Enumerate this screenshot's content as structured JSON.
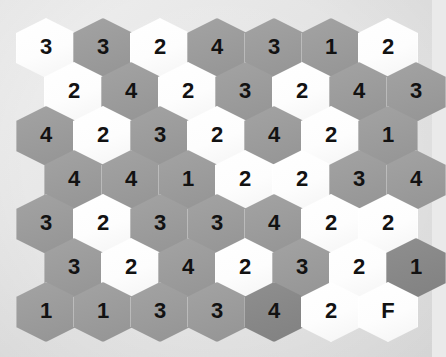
{
  "app": {
    "name": "hex-number-grid",
    "title": "Hexagonal Number Grid Puzzle"
  },
  "board": {
    "background_color": "#e4e4e4",
    "rows": 7,
    "columns": 7,
    "tile_colors": {
      "light": "#ffffff",
      "gray": "#9b9b9b",
      "dark": "#878787"
    },
    "text_color": "#121212"
  },
  "grid": {
    "rows": [
      {
        "index": 1,
        "offset": false,
        "cells": [
          {
            "value": "3",
            "shade": "light"
          },
          {
            "value": "3",
            "shade": "gray"
          },
          {
            "value": "2",
            "shade": "light"
          },
          {
            "value": "4",
            "shade": "gray"
          },
          {
            "value": "3",
            "shade": "gray"
          },
          {
            "value": "1",
            "shade": "gray"
          },
          {
            "value": "2",
            "shade": "light"
          }
        ]
      },
      {
        "index": 2,
        "offset": true,
        "cells": [
          {
            "value": "2",
            "shade": "light"
          },
          {
            "value": "4",
            "shade": "gray"
          },
          {
            "value": "2",
            "shade": "light"
          },
          {
            "value": "3",
            "shade": "gray"
          },
          {
            "value": "2",
            "shade": "light"
          },
          {
            "value": "4",
            "shade": "gray"
          },
          {
            "value": "3",
            "shade": "gray"
          }
        ]
      },
      {
        "index": 3,
        "offset": false,
        "cells": [
          {
            "value": "4",
            "shade": "gray"
          },
          {
            "value": "2",
            "shade": "light"
          },
          {
            "value": "3",
            "shade": "gray"
          },
          {
            "value": "2",
            "shade": "light"
          },
          {
            "value": "4",
            "shade": "gray"
          },
          {
            "value": "2",
            "shade": "light"
          },
          {
            "value": "1",
            "shade": "gray"
          }
        ]
      },
      {
        "index": 4,
        "offset": true,
        "cells": [
          {
            "value": "4",
            "shade": "gray"
          },
          {
            "value": "4",
            "shade": "gray"
          },
          {
            "value": "1",
            "shade": "gray"
          },
          {
            "value": "2",
            "shade": "light"
          },
          {
            "value": "2",
            "shade": "light"
          },
          {
            "value": "3",
            "shade": "gray"
          },
          {
            "value": "4",
            "shade": "gray"
          }
        ]
      },
      {
        "index": 5,
        "offset": false,
        "cells": [
          {
            "value": "3",
            "shade": "gray"
          },
          {
            "value": "2",
            "shade": "light"
          },
          {
            "value": "3",
            "shade": "gray"
          },
          {
            "value": "3",
            "shade": "gray"
          },
          {
            "value": "4",
            "shade": "gray"
          },
          {
            "value": "2",
            "shade": "light"
          },
          {
            "value": "2",
            "shade": "light"
          }
        ]
      },
      {
        "index": 6,
        "offset": true,
        "cells": [
          {
            "value": "3",
            "shade": "gray"
          },
          {
            "value": "2",
            "shade": "light"
          },
          {
            "value": "4",
            "shade": "gray"
          },
          {
            "value": "2",
            "shade": "light"
          },
          {
            "value": "3",
            "shade": "gray"
          },
          {
            "value": "2",
            "shade": "light"
          },
          {
            "value": "1",
            "shade": "dark"
          }
        ]
      },
      {
        "index": 7,
        "offset": false,
        "cells": [
          {
            "value": "1",
            "shade": "gray"
          },
          {
            "value": "1",
            "shade": "gray"
          },
          {
            "value": "3",
            "shade": "gray"
          },
          {
            "value": "3",
            "shade": "gray"
          },
          {
            "value": "4",
            "shade": "dark"
          },
          {
            "value": "2",
            "shade": "light"
          },
          {
            "value": "F",
            "shade": "light"
          }
        ]
      }
    ]
  },
  "overlays": {
    "drag_arrow": {
      "name": "drag-arrow",
      "color": "#ffffff",
      "start_x": 62,
      "start_y": 48,
      "end_x": 196,
      "end_y": 48,
      "direction": "right"
    },
    "leader_line": {
      "name": "leader-line",
      "color": "#ffffff",
      "start_x": 140,
      "start_y": 62,
      "end_x": 100,
      "end_y": 134
    },
    "cursor": {
      "name": "mouse-cursor",
      "color": "#ffffff",
      "x": 100,
      "y": 128
    }
  },
  "geometry": {
    "hex_width": 60,
    "hex_height": 60,
    "step_x": 57,
    "step_y": 44,
    "origin_x": 16,
    "origin_y": 18,
    "offset_x": 28
  }
}
